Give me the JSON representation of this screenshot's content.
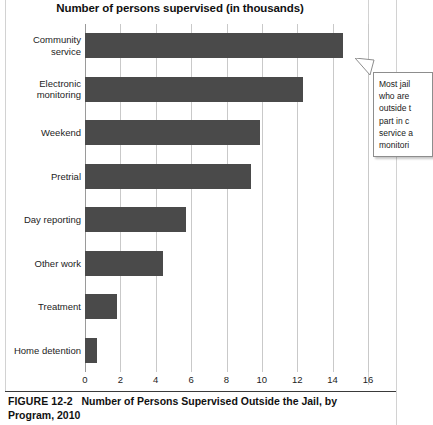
{
  "chart_data": {
    "type": "bar",
    "orientation": "horizontal",
    "title": "Number of persons supervised (in thousands)",
    "xlabel": "",
    "ylabel": "",
    "categories": [
      "Community service",
      "Electronic monitoring",
      "Weekend",
      "Pretrial",
      "Day reporting",
      "Other work",
      "Treatment",
      "Home detention"
    ],
    "values": [
      14.6,
      12.3,
      9.9,
      9.4,
      5.7,
      4.4,
      1.8,
      0.7
    ],
    "xlim": [
      0,
      16
    ],
    "xticks": [
      0,
      2,
      4,
      6,
      8,
      10,
      12,
      14,
      16
    ],
    "xtick_labels": [
      "0",
      "2",
      "4",
      "6",
      "8",
      "10",
      "12",
      "14",
      "16"
    ],
    "grid": true,
    "grid_axis": "x",
    "legend": null,
    "bar_color": "#4a4a4a",
    "grid_color": "#c9c9c9",
    "background": "#ffffff"
  },
  "chart": {
    "title": "Number of persons supervised (in thousands)",
    "bars": [
      {
        "label_line1": "Community",
        "label_line2": "service",
        "value": 14.6
      },
      {
        "label_line1": "Electronic",
        "label_line2": "monitoring",
        "value": 12.3
      },
      {
        "label_line1": "Weekend",
        "label_line2": "",
        "value": 9.9
      },
      {
        "label_line1": "Pretrial",
        "label_line2": "",
        "value": 9.4
      },
      {
        "label_line1": "Day reporting",
        "label_line2": "",
        "value": 5.7
      },
      {
        "label_line1": "Other work",
        "label_line2": "",
        "value": 4.4
      },
      {
        "label_line1": "Treatment",
        "label_line2": "",
        "value": 1.8
      },
      {
        "label_line1": "Home detention",
        "label_line2": "",
        "value": 0.7
      }
    ],
    "xticks": [
      "0",
      "2",
      "4",
      "6",
      "8",
      "10",
      "12",
      "14",
      "16"
    ]
  },
  "callout": {
    "lines": [
      "Most jail",
      "who are",
      "outside t",
      "part in c",
      "service a",
      "monitori"
    ]
  },
  "caption": {
    "figure_number": "FIGURE 12-2",
    "text": "Number of Persons Supervised Outside the Jail, by Program, 2010"
  }
}
